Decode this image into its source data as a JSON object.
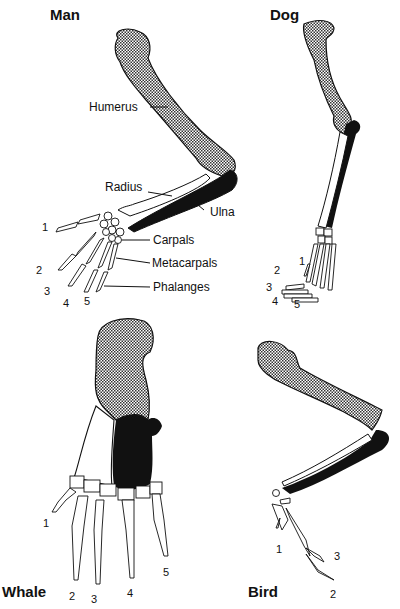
{
  "panels": {
    "man": {
      "title": "Man",
      "labels": {
        "humerus": "Humerus",
        "radius": "Radius",
        "ulna": "Ulna",
        "carpals": "Carpals",
        "metacarpals": "Metacarpals",
        "phalanges": "Phalanges"
      },
      "digits": [
        "1",
        "2",
        "3",
        "4",
        "5"
      ]
    },
    "dog": {
      "title": "Dog",
      "digits": [
        "1",
        "2",
        "3",
        "4",
        "5"
      ]
    },
    "whale": {
      "title": "Whale",
      "digits": [
        "1",
        "2",
        "3",
        "4",
        "5"
      ]
    },
    "bird": {
      "title": "Bird",
      "digits": [
        "1",
        "3",
        "2"
      ]
    }
  },
  "legend_colors": {
    "humerus": "#8a8a8a",
    "radius": "#ffffff",
    "ulna": "#111111",
    "outline": "#111111"
  }
}
